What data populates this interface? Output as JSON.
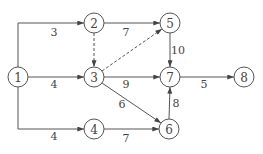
{
  "diagram": {
    "type": "activity-network",
    "nodes": [
      {
        "id": "1",
        "label": "1"
      },
      {
        "id": "2",
        "label": "2"
      },
      {
        "id": "3",
        "label": "3"
      },
      {
        "id": "4",
        "label": "4"
      },
      {
        "id": "5",
        "label": "5"
      },
      {
        "id": "6",
        "label": "6"
      },
      {
        "id": "7",
        "label": "7"
      },
      {
        "id": "8",
        "label": "8"
      }
    ],
    "edges": [
      {
        "from": "1",
        "to": "2",
        "weight": "3",
        "dummy": false
      },
      {
        "from": "1",
        "to": "3",
        "weight": "4",
        "dummy": false
      },
      {
        "from": "1",
        "to": "4",
        "weight": "4",
        "dummy": false
      },
      {
        "from": "2",
        "to": "5",
        "weight": "7",
        "dummy": false
      },
      {
        "from": "2",
        "to": "3",
        "weight": "",
        "dummy": true
      },
      {
        "from": "3",
        "to": "5",
        "weight": "",
        "dummy": true
      },
      {
        "from": "3",
        "to": "7",
        "weight": "9",
        "dummy": false
      },
      {
        "from": "3",
        "to": "6",
        "weight": "6",
        "dummy": false
      },
      {
        "from": "4",
        "to": "6",
        "weight": "7",
        "dummy": false
      },
      {
        "from": "5",
        "to": "7",
        "weight": "10",
        "dummy": false
      },
      {
        "from": "6",
        "to": "7",
        "weight": "8",
        "dummy": false
      },
      {
        "from": "7",
        "to": "8",
        "weight": "5",
        "dummy": false
      }
    ]
  }
}
